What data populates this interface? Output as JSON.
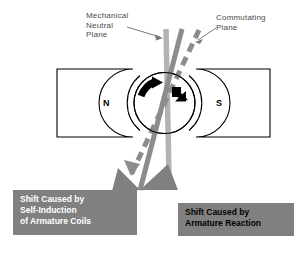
{
  "diagram": {
    "colors": {
      "mechanical_plane": "#b3b3b3",
      "commutating_solid": "#8c8c8c",
      "commutating_dashed": "#8c8c8c",
      "callout_box": "#808080",
      "callout_text_left": "#ffffff",
      "callout_text_right": "#000000",
      "label_text": "#4a4a4a",
      "outline": "#000000",
      "background": "#ffffff"
    },
    "labels": {
      "mechanical_neutral_plane": "Mechanical\nNeutral\nPlane",
      "commutating_plane": "Commutating\nPlane"
    },
    "poles": {
      "north": "N",
      "south": "S"
    },
    "callouts": [
      {
        "id": "self-induction",
        "text": "Shift Caused by\nSelf-Induction\nof Armature Coils"
      },
      {
        "id": "armature-reaction",
        "text": "Shift Caused by\nArmature Reaction"
      }
    ],
    "icons": {
      "rotation_arrow": "rotation-arrow-icon",
      "brush_shift_arrow": "brush-shift-arrow-icon",
      "pointer_mechanical": "pointer-arrow-icon",
      "pointer_commutating": "pointer-arrow-icon"
    }
  }
}
